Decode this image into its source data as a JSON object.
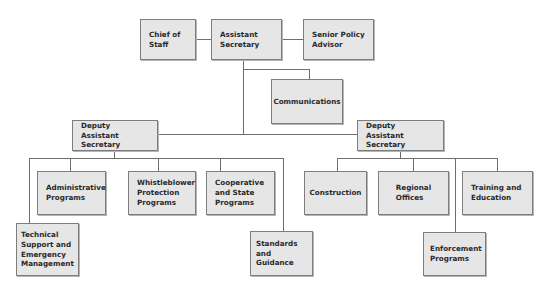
{
  "chart": {
    "type": "org_chart",
    "top": {
      "left": "Chief of\nStaff",
      "center": "Assistant\nSecretary",
      "right": "Senior Policy\nAdvisor"
    },
    "communications": "Communications",
    "deputy_left": {
      "title": "Deputy Assistant\nSecretary",
      "children": [
        "Administrative\nPrograms",
        "Whistleblower\nProtection\nPrograms",
        "Cooperative\nand State\nPrograms",
        "Technical\nSupport and\nEmergency\nManagement",
        "Standards\nand Guidance"
      ]
    },
    "deputy_right": {
      "title": "Deputy Assistant\nSecretary",
      "children": [
        "Construction",
        "Regional\nOffices",
        "Training and\nEducation",
        "Enforcement\nPrograms"
      ]
    }
  }
}
